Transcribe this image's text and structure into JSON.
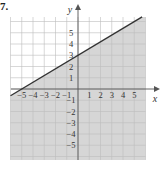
{
  "problem": {
    "label": "7."
  },
  "colors": {
    "shade": "#d6d6d6",
    "grid": "#bdbdbd",
    "grid_unshaded": "#dcdcdc",
    "axis": "#555555",
    "line": "#333333",
    "text": "#333333"
  },
  "chart_data": {
    "type": "line",
    "title": "7.",
    "xlabel": "x",
    "ylabel": "y",
    "xlim": [
      -6,
      6
    ],
    "ylim": [
      -6.3,
      6.4
    ],
    "grid": true,
    "x_ticks": [
      -5,
      -4,
      -3,
      -2,
      -1,
      1,
      2,
      3,
      4,
      5
    ],
    "y_ticks": [
      -5,
      -4,
      -3,
      -2,
      -1,
      1,
      2,
      3,
      4,
      5
    ],
    "x_tick_labels": [
      "−5",
      "−4",
      "−3",
      "−2",
      "−1",
      "1",
      "2",
      "3",
      "4",
      "5"
    ],
    "y_tick_labels": [
      "−5",
      "−4",
      "−3",
      "−2",
      "−1",
      "1",
      "2",
      "3",
      "4",
      "5"
    ],
    "series": [
      {
        "name": "boundary line",
        "equation": "y = 0.6x + 3",
        "style": "solid",
        "x": [
          -6,
          5.7
        ],
        "y": [
          -0.6,
          6.42
        ]
      }
    ],
    "points_on_line": [
      [
        -5,
        0
      ],
      [
        0,
        3
      ]
    ],
    "shaded_region": "below line",
    "inequality": "y ≤ (3/5)x + 3"
  }
}
